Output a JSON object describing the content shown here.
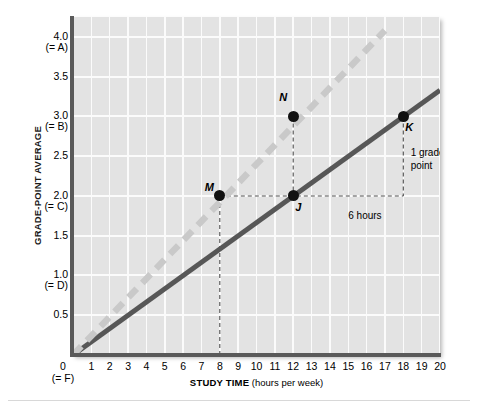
{
  "chart_data": {
    "type": "line",
    "title": "",
    "xlabel": "STUDY TIME (hours per week)",
    "ylabel": "GRADE-POINT AVERAGE",
    "xlim": [
      0,
      20
    ],
    "ylim": [
      0,
      4.25
    ],
    "grid": true,
    "legend": "none",
    "x_tick_labels": [
      "1",
      "2",
      "3",
      "4",
      "5",
      "6",
      "7",
      "8",
      "9",
      "10",
      "11",
      "12",
      "13",
      "14",
      "15",
      "16",
      "17",
      "18",
      "19",
      "20"
    ],
    "x_tick_values": [
      1,
      2,
      3,
      4,
      5,
      6,
      7,
      8,
      9,
      10,
      11,
      12,
      13,
      14,
      15,
      16,
      17,
      18,
      19,
      20
    ],
    "x_origin_label": "0",
    "x_origin_sublabel": "(= F)",
    "y_ticks": [
      {
        "value": 4.0,
        "label": "4.0",
        "sublabel": "(= A)"
      },
      {
        "value": 3.5,
        "label": "3.5",
        "sublabel": ""
      },
      {
        "value": 3.0,
        "label": "3.0",
        "sublabel": "(= B)"
      },
      {
        "value": 2.5,
        "label": "2.5",
        "sublabel": ""
      },
      {
        "value": 2.0,
        "label": "2.0",
        "sublabel": "(= C)"
      },
      {
        "value": 1.5,
        "label": "1.5",
        "sublabel": ""
      },
      {
        "value": 1.0,
        "label": "1.0",
        "sublabel": "(= D)"
      },
      {
        "value": 0.5,
        "label": "0.5",
        "sublabel": ""
      }
    ],
    "series": [
      {
        "name": "solid-line",
        "style": "solid",
        "color": "#575757",
        "points": [
          {
            "x": 0,
            "y": 0
          },
          {
            "x": 20,
            "y": 3.33
          }
        ]
      },
      {
        "name": "dashed-line",
        "style": "dashed",
        "color": "#c9c9c9",
        "points": [
          {
            "x": 0,
            "y": 0
          },
          {
            "x": 17,
            "y": 4.08
          }
        ]
      }
    ],
    "data_points": [
      {
        "label": "M",
        "x": 8,
        "y": 2.0,
        "label_position": "left"
      },
      {
        "label": "N",
        "x": 12,
        "y": 3.0,
        "label_position": "above-left"
      },
      {
        "label": "J",
        "x": 12,
        "y": 2.0,
        "label_position": "below-right"
      },
      {
        "label": "K",
        "x": 18,
        "y": 3.0,
        "label_position": "below-right"
      }
    ],
    "annotations": [
      {
        "name": "run-label",
        "text": "6 hours",
        "x": 15,
        "y": 1.82
      },
      {
        "name": "rise-label-line1",
        "text": "1 grade",
        "x": 18.4,
        "y": 2.62
      },
      {
        "name": "rise-label-line2",
        "text": "point",
        "x": 18.4,
        "y": 2.45
      }
    ],
    "guide_lines": [
      {
        "name": "m-vertical-guide",
        "from": {
          "x": 8,
          "y": 0
        },
        "to": {
          "x": 8,
          "y": 2.0
        }
      },
      {
        "name": "m-to-j-horizontal-guide",
        "from": {
          "x": 8,
          "y": 2.0
        },
        "to": {
          "x": 18,
          "y": 2.0
        }
      },
      {
        "name": "n-to-j-vertical-guide",
        "from": {
          "x": 12,
          "y": 3.0
        },
        "to": {
          "x": 12,
          "y": 2.0
        }
      },
      {
        "name": "k-vertical-guide",
        "from": {
          "x": 18,
          "y": 3.0
        },
        "to": {
          "x": 18,
          "y": 2.0
        }
      }
    ],
    "colors": {
      "plot_background": "#e3e3e3",
      "gridline": "#fbfbfb",
      "axis": "#5a5a5a",
      "solid_series": "#575757",
      "dashed_series": "#c9c9c9",
      "point": "#111111",
      "guide": "#4d4d4d"
    }
  }
}
